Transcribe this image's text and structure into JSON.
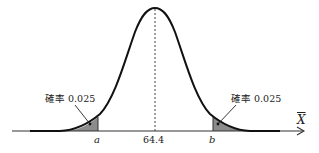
{
  "diagram": {
    "type": "normal_distribution",
    "mean_label": "64.4",
    "left_bound_label": "a",
    "right_bound_label": "b",
    "axis_label": "X",
    "left_tail": {
      "prefix": "確率",
      "value": "0.025"
    },
    "right_tail": {
      "prefix": "確率",
      "value": "0.025"
    },
    "colors": {
      "curve": "#111111",
      "shade": "#8c8c8c",
      "axis": "#333333",
      "mean_line": "#444444"
    }
  }
}
